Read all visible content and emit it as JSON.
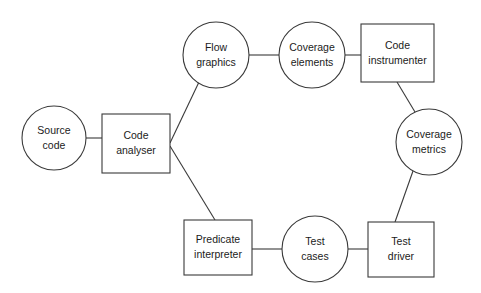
{
  "diagram": {
    "type": "data-flow-diagram",
    "title": "",
    "canvas": {
      "width": 481,
      "height": 293,
      "background": "#ffffff"
    },
    "style": {
      "stroke_color": "#3a3a3a",
      "fill_color": "#ffffff",
      "text_color": "#1b1b1b"
    },
    "nodes": [
      {
        "id": "source-code",
        "shape": "circle",
        "label_line1": "Source",
        "label_line2": "code",
        "cx": 54,
        "cy": 138,
        "r": 32
      },
      {
        "id": "code-analyser",
        "shape": "rect",
        "label_line1": "Code",
        "label_line2": "analyser",
        "x": 102,
        "y": 114,
        "width": 68,
        "height": 59
      },
      {
        "id": "flow-graphics",
        "shape": "circle",
        "label_line1": "Flow",
        "label_line2": "graphics",
        "cx": 216,
        "cy": 55,
        "r": 33
      },
      {
        "id": "coverage-elements",
        "shape": "circle",
        "label_line1": "Coverage",
        "label_line2": "elements",
        "cx": 312,
        "cy": 55,
        "r": 33
      },
      {
        "id": "code-instrumenter",
        "shape": "rect",
        "label_line1": "Code",
        "label_line2": "instrumenter",
        "x": 361,
        "y": 24,
        "width": 73,
        "height": 58
      },
      {
        "id": "coverage-metrics",
        "shape": "circle",
        "label_line1": "Coverage",
        "label_line2": "metrics",
        "cx": 429,
        "cy": 142,
        "r": 33
      },
      {
        "id": "test-driver",
        "shape": "rect",
        "label_line1": "Test",
        "label_line2": "driver",
        "x": 368,
        "y": 222,
        "width": 66,
        "height": 55
      },
      {
        "id": "test-cases",
        "shape": "circle",
        "label_line1": "Test",
        "label_line2": "cases",
        "cx": 315,
        "cy": 249,
        "r": 33
      },
      {
        "id": "predicate-interpreter",
        "shape": "rect",
        "label_line1": "Predicate",
        "label_line2": "interpreter",
        "x": 184,
        "y": 220,
        "width": 68,
        "height": 55
      }
    ],
    "edges": [
      {
        "id": "source-code-to-code-analyser",
        "from": "source-code",
        "to": "code-analyser",
        "x1": 86,
        "y1": 138,
        "x2": 102,
        "y2": 138
      },
      {
        "id": "code-analyser-to-flow-graphics",
        "from": "code-analyser",
        "to": "flow-graphics",
        "x1": 170,
        "y1": 143,
        "x2": 199,
        "y2": 82
      },
      {
        "id": "flow-graphics-to-coverage-elements",
        "from": "flow-graphics",
        "to": "coverage-elements",
        "x1": 249,
        "y1": 55,
        "x2": 279,
        "y2": 55
      },
      {
        "id": "coverage-elements-to-code-instrumenter",
        "from": "coverage-elements",
        "to": "code-instrumenter",
        "x1": 345,
        "y1": 55,
        "x2": 361,
        "y2": 55
      },
      {
        "id": "code-instrumenter-to-coverage-metrics",
        "from": "code-instrumenter",
        "to": "coverage-metrics",
        "x1": 397,
        "y1": 82,
        "x2": 415,
        "y2": 112
      },
      {
        "id": "coverage-metrics-to-test-driver",
        "from": "coverage-metrics",
        "to": "test-driver",
        "x1": 413,
        "y1": 171,
        "x2": 395,
        "y2": 222
      },
      {
        "id": "test-driver-to-test-cases",
        "from": "test-driver",
        "to": "test-cases",
        "x1": 368,
        "y1": 249,
        "x2": 348,
        "y2": 249
      },
      {
        "id": "test-cases-to-predicate-interpreter",
        "from": "test-cases",
        "to": "predicate-interpreter",
        "x1": 282,
        "y1": 249,
        "x2": 252,
        "y2": 249
      },
      {
        "id": "predicate-interpreter-to-code-analyser",
        "from": "predicate-interpreter",
        "to": "code-analyser",
        "x1": 215,
        "y1": 220,
        "x2": 170,
        "y2": 146
      }
    ]
  }
}
